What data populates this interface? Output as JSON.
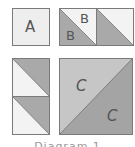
{
  "diagram": {
    "type": "quilt-block-piecing-diagram",
    "pieces": [
      {
        "id": "square-a",
        "label": "A",
        "shape": "square"
      },
      {
        "id": "hst-b-1",
        "label_upper": "B",
        "label_lower": "B",
        "shape": "half-square-triangle"
      },
      {
        "id": "hst-b-2",
        "shape": "half-square-triangle"
      },
      {
        "id": "hst-left-top",
        "shape": "half-square-triangle"
      },
      {
        "id": "hst-left-bottom",
        "shape": "half-square-triangle"
      },
      {
        "id": "hst-c",
        "label_upper": "C",
        "label_lower": "C",
        "shape": "half-square-triangle"
      }
    ],
    "caption": "Diagram 1"
  },
  "labels": {
    "a": "A",
    "b_upper": "B",
    "b_lower": "B",
    "c_upper": "C",
    "c_lower": "C"
  },
  "colors": {
    "light": "#eeeeee",
    "lighter": "#f3f3f3",
    "medium": "#a9a9a9",
    "c_light": "#c6c6c6",
    "c_dark": "#a4a4a4",
    "border": "#7a7a7a"
  }
}
